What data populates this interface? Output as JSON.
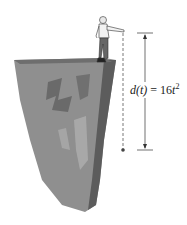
{
  "figure": {
    "equation": {
      "lhs": "d(t)",
      "equals": "=",
      "coefficient": "16",
      "variable": "t",
      "exponent": "2"
    },
    "colors": {
      "cliff_light": "#9a9a9a",
      "cliff_dark": "#5a5a5a",
      "line": "#333333"
    }
  }
}
